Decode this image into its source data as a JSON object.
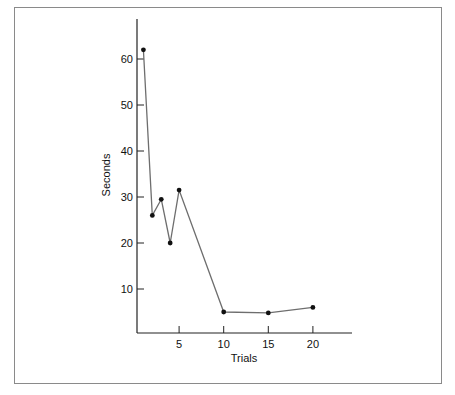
{
  "chart_data": {
    "type": "line",
    "title": "",
    "xlabel": "Trials",
    "ylabel": "Seconds",
    "x": [
      1,
      2,
      3,
      4,
      5,
      10,
      15,
      20
    ],
    "series": [
      {
        "name": "Seconds",
        "values": [
          62,
          26,
          29.5,
          20,
          31.5,
          5,
          4.8,
          6
        ]
      }
    ],
    "xticks": [
      5,
      10,
      15,
      20
    ],
    "yticks": [
      10,
      20,
      30,
      40,
      50,
      60
    ],
    "xlim": [
      0,
      24
    ],
    "ylim": [
      0,
      67
    ],
    "grid": false,
    "legend": null,
    "colors": {
      "line": "#6e6e6e",
      "marker": "#111111",
      "axis": "#222222",
      "frame": "#8a8a8a"
    }
  }
}
